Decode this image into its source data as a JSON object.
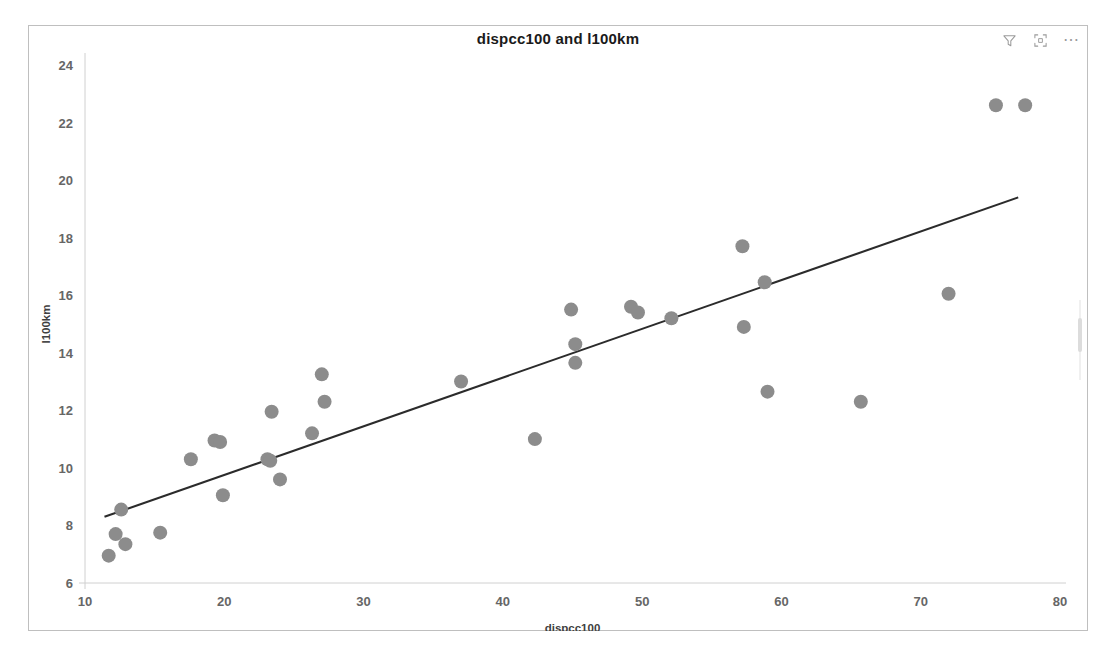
{
  "visual": {
    "title": "dispcc100 and l100km",
    "actions": [
      {
        "name": "filter-icon",
        "label": "Filters"
      },
      {
        "name": "focus-mode-icon",
        "label": "Focus mode"
      },
      {
        "name": "more-options-icon",
        "label": "More options"
      }
    ],
    "more_options_glyph": "⋯"
  },
  "chart_data": {
    "type": "scatter",
    "title": "dispcc100 and l100km",
    "xlabel": "dispcc100",
    "ylabel": "l100km",
    "xlim": [
      10,
      80
    ],
    "ylim": [
      6,
      24
    ],
    "xticks": [
      10,
      20,
      30,
      40,
      50,
      60,
      70,
      80
    ],
    "yticks": [
      6,
      8,
      10,
      12,
      14,
      16,
      18,
      20,
      22,
      24
    ],
    "grid": false,
    "legend": "none",
    "marker_color": "#8c8c8c",
    "marker_radius_px": 7,
    "series": [
      {
        "name": "l100km by dispcc100",
        "points": [
          [
            11.7,
            6.95
          ],
          [
            12.2,
            7.7
          ],
          [
            12.6,
            8.55
          ],
          [
            12.9,
            7.35
          ],
          [
            15.4,
            7.75
          ],
          [
            17.6,
            10.3
          ],
          [
            19.3,
            10.95
          ],
          [
            19.7,
            10.9
          ],
          [
            19.9,
            9.05
          ],
          [
            23.1,
            10.3
          ],
          [
            23.3,
            10.25
          ],
          [
            23.4,
            11.95
          ],
          [
            24.0,
            9.6
          ],
          [
            26.3,
            11.2
          ],
          [
            27.0,
            13.25
          ],
          [
            27.2,
            12.3
          ],
          [
            37.0,
            13.0
          ],
          [
            42.3,
            11.0
          ],
          [
            44.9,
            15.5
          ],
          [
            45.2,
            14.3
          ],
          [
            45.2,
            13.65
          ],
          [
            49.2,
            15.6
          ],
          [
            49.7,
            15.4
          ],
          [
            52.1,
            15.2
          ],
          [
            57.2,
            17.7
          ],
          [
            57.3,
            14.9
          ],
          [
            58.8,
            16.45
          ],
          [
            59.0,
            12.65
          ],
          [
            65.7,
            12.3
          ],
          [
            72.0,
            16.05
          ],
          [
            75.4,
            22.6
          ],
          [
            77.5,
            22.6
          ]
        ]
      }
    ],
    "trendline": {
      "type": "linear-fit",
      "color": "#2b2b2b",
      "x_start": 11.4,
      "y_start": 8.3,
      "x_end": 77.0,
      "y_end": 19.4
    }
  }
}
